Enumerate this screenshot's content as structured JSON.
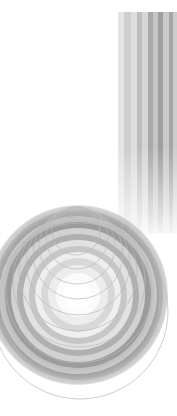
{
  "canvas": {
    "width": 177,
    "height": 416,
    "background": "#ffffff"
  },
  "caption": {
    "text": "",
    "color": "#f2f2f2"
  },
  "chart_data": {
    "type": "scatter",
    "title": "",
    "subtitle": "",
    "xlabel": "",
    "ylabel": "",
    "xlim": [
      0,
      177
    ],
    "ylim": [
      0,
      416
    ],
    "grid": false,
    "legend": "none",
    "palette": {
      "background": "#ffffff",
      "stripe_light": "#e8e8e8",
      "stripe_mid": "#c8c8c8",
      "stripe_dark": "#9a9a9a",
      "ring_dark": "#8e8e8e",
      "ring_mid": "#b4b4b4",
      "ring_light": "#dcdcdc",
      "ring_core": "#ffffff",
      "outline": "#b9b9b9"
    },
    "stripe_band": {
      "x": 118,
      "y": 12,
      "width": 59,
      "height": 222,
      "fade_start": 0.62,
      "stripes": [
        {
          "x": 118,
          "width": 6,
          "color": "#e4e4e4"
        },
        {
          "x": 124,
          "width": 7,
          "color": "#cfcfcf"
        },
        {
          "x": 131,
          "width": 6,
          "color": "#dedede"
        },
        {
          "x": 137,
          "width": 5,
          "color": "#bdbdbd"
        },
        {
          "x": 142,
          "width": 6,
          "color": "#d6d6d6"
        },
        {
          "x": 148,
          "width": 5,
          "color": "#a9a9a9"
        },
        {
          "x": 153,
          "width": 5,
          "color": "#c4c4c4"
        },
        {
          "x": 158,
          "width": 5,
          "color": "#9f9f9f"
        },
        {
          "x": 163,
          "width": 6,
          "color": "#c9c9c9"
        },
        {
          "x": 169,
          "width": 4,
          "color": "#a5a5a5"
        },
        {
          "x": 173,
          "width": 4,
          "color": "#cdcdcd"
        }
      ]
    },
    "outline_circles": {
      "stroke": "#b9b9b9",
      "stroke_width": 0.7,
      "circles": [
        {
          "cx": 80,
          "cy": 311,
          "r": 88
        },
        {
          "cx": 80,
          "cy": 300,
          "r": 80
        },
        {
          "cx": 79,
          "cy": 290,
          "r": 73
        },
        {
          "cx": 79,
          "cy": 281,
          "r": 66
        },
        {
          "cx": 78,
          "cy": 272,
          "r": 59
        },
        {
          "cx": 78,
          "cy": 263,
          "r": 52
        },
        {
          "cx": 78,
          "cy": 254,
          "r": 45
        },
        {
          "cx": 77,
          "cy": 246,
          "r": 38
        },
        {
          "cx": 77,
          "cy": 238,
          "r": 31
        },
        {
          "cx": 76,
          "cy": 231,
          "r": 24
        }
      ]
    },
    "radial_rings": {
      "cx": 78,
      "cy": 295,
      "bands": [
        {
          "r": 14,
          "color": "#ffffff"
        },
        {
          "r": 22,
          "color": "#fbfbfb"
        },
        {
          "r": 30,
          "color": "#ededed"
        },
        {
          "r": 37,
          "color": "#d8d8d8"
        },
        {
          "r": 43,
          "color": "#efefef"
        },
        {
          "r": 49,
          "color": "#c6c6c6"
        },
        {
          "r": 55,
          "color": "#e2e2e2"
        },
        {
          "r": 61,
          "color": "#b0b0b0"
        },
        {
          "r": 67,
          "color": "#d2d2d2"
        },
        {
          "r": 73,
          "color": "#9c9c9c"
        },
        {
          "r": 79,
          "color": "#c0c0c0"
        },
        {
          "r": 85,
          "color": "#8e8e8e"
        },
        {
          "r": 90,
          "color": "#ababab"
        }
      ]
    }
  }
}
